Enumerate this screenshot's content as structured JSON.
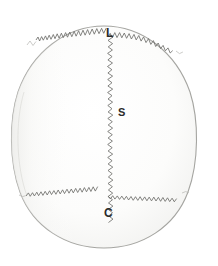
{
  "figure": {
    "type": "anatomical-illustration",
    "background_color": "#ffffff"
  },
  "skull": {
    "outline_color": "#a8a8a4",
    "fill_color": "#fbfbfa",
    "shading_color": "#f2f2f0",
    "center_x": 104,
    "center_y": 138,
    "radius_x": 92,
    "radius_y": 112
  },
  "sutures": [
    {
      "id": "lambdoid",
      "label": "L",
      "label_x": 106,
      "label_y": 27,
      "orientation": "transverse-anterior",
      "line_color": "#6d6d6a"
    },
    {
      "id": "sagittal",
      "label": "S",
      "label_x": 118,
      "label_y": 107,
      "orientation": "midline-vertical",
      "line_color": "#6d6d6a"
    },
    {
      "id": "coronal",
      "label": "C",
      "label_x": 104,
      "label_y": 207,
      "orientation": "transverse-posterior",
      "line_color": "#6d6d6a"
    }
  ]
}
